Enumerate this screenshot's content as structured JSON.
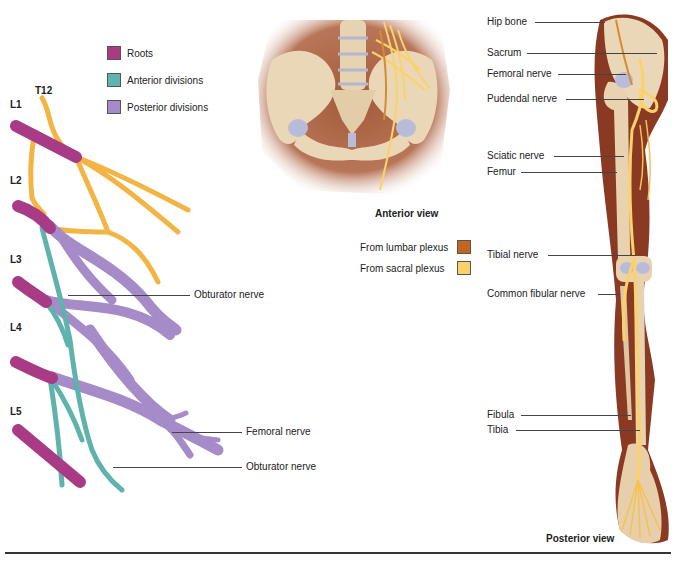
{
  "plexus_diagram": {
    "legend": [
      {
        "label": "Roots",
        "color": "#a83a86"
      },
      {
        "label": "Anterior divisions",
        "color": "#5fb3ad"
      },
      {
        "label": "Posterior divisions",
        "color": "#a58cc8"
      }
    ],
    "level_labels": [
      "T12",
      "L1",
      "L2",
      "L3",
      "L4",
      "L5"
    ],
    "callouts": [
      "Obturator nerve",
      "Femoral nerve",
      "Obturator nerve"
    ],
    "nerve_color": "#f2b544"
  },
  "anterior_view": {
    "caption": "Anterior view",
    "legend": [
      {
        "label": "From lumbar plexus",
        "color": "#c0661e"
      },
      {
        "label": "From sacral plexus",
        "color": "#fbd26a"
      }
    ]
  },
  "posterior_view": {
    "caption": "Posterior view",
    "callouts": [
      "Hip bone",
      "Sacrum",
      "Femoral nerve",
      "Pudendal nerve",
      "Sciatic nerve",
      "Femur",
      "Tibial nerve",
      "Common fibular nerve",
      "Fibula",
      "Tibia"
    ],
    "skin_color": "#8a3a22",
    "bone_color": "#ead7b8"
  }
}
